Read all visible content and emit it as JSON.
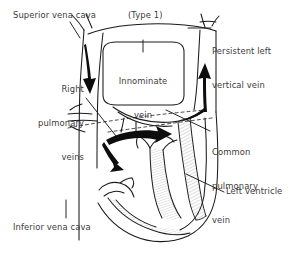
{
  "figure": {
    "type_label": "(Type 1)",
    "background_color": "#ffffff",
    "ink_color": "#1a1a1a",
    "text_color": "#3b3b3b"
  },
  "labels": {
    "superior_vena_cava": "Superior vena cava",
    "type": "(Type 1)",
    "persistent_left_vertical_vein_line1": "Persistent left",
    "persistent_left_vertical_vein_line2": "vertical vein",
    "right_pulmonary_veins_line1": "Right",
    "right_pulmonary_veins_line2": "pulmonary",
    "right_pulmonary_veins_line3": "veins",
    "innominate_vein_line1": "Innominate",
    "innominate_vein_line2": "vein",
    "common_pulmonary_vein_line1": "Common",
    "common_pulmonary_vein_line2": "pulmonary",
    "common_pulmonary_vein_line3": "vein",
    "left_ventricle": "Left ventricle",
    "inferior_vena_cava": "Inferior vena cava"
  },
  "anatomy": {
    "structures": [
      "superior vena cava",
      "innominate vein",
      "persistent left vertical vein",
      "right pulmonary veins",
      "common pulmonary vein",
      "left ventricle",
      "inferior vena cava"
    ],
    "flow_arrows": [
      {
        "name": "svc-downward-flow-arrow",
        "direction": "down"
      },
      {
        "name": "vertical-vein-upward-flow-arrow",
        "direction": "up"
      },
      {
        "name": "pulmonary-venous-rightward-flow-arrow",
        "direction": "right"
      },
      {
        "name": "descending-flow-arrow",
        "direction": "down-right"
      }
    ]
  }
}
